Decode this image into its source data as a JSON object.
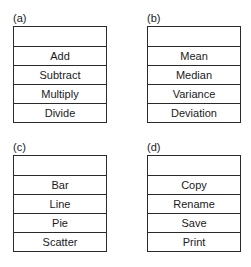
{
  "panels": [
    {
      "label": "(a)",
      "title": "",
      "items": [
        "Add",
        "Subtract",
        "Multiply",
        "Divide"
      ]
    },
    {
      "label": "(b)",
      "title": "",
      "items": [
        "Mean",
        "Median",
        "Variance",
        "Deviation"
      ]
    },
    {
      "label": "(c)",
      "title": "",
      "items": [
        "Bar",
        "Line",
        "Pie",
        "Scatter"
      ]
    },
    {
      "label": "(d)",
      "title": "",
      "items": [
        "Copy",
        "Rename",
        "Save",
        "Print"
      ]
    }
  ]
}
